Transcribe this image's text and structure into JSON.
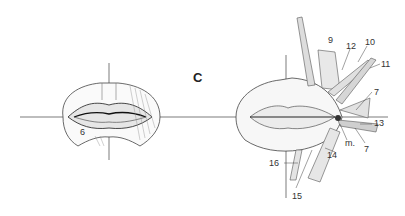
{
  "figure": {
    "panel_letter": "C",
    "left_view": {
      "labels": [
        {
          "text": "6",
          "x": 80,
          "y": 133
        }
      ]
    },
    "right_view": {
      "labels": [
        {
          "text": "9",
          "x": 328,
          "y": 36
        },
        {
          "text": "12",
          "x": 349,
          "y": 43
        },
        {
          "text": "10",
          "x": 366,
          "y": 40
        },
        {
          "text": "11",
          "x": 381,
          "y": 60
        },
        {
          "text": "7",
          "x": 374,
          "y": 88
        },
        {
          "text": "13",
          "x": 374,
          "y": 120
        },
        {
          "text": "7",
          "x": 364,
          "y": 145
        },
        {
          "text": "m.",
          "x": 345,
          "y": 140
        },
        {
          "text": "14",
          "x": 327,
          "y": 151
        },
        {
          "text": "16",
          "x": 270,
          "y": 160
        },
        {
          "text": "15",
          "x": 292,
          "y": 192
        }
      ]
    },
    "colors": {
      "line": "#333333",
      "shade": "#888888",
      "background": "#ffffff"
    }
  }
}
